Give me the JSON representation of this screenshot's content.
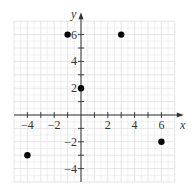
{
  "chart_data": {
    "type": "scatter",
    "title": "",
    "xlabel": "x",
    "ylabel": "y",
    "xlim": [
      -5,
      7
    ],
    "ylim": [
      -5,
      7
    ],
    "grid": true,
    "x_ticks": [
      -4,
      -2,
      2,
      4,
      6
    ],
    "y_ticks": [
      -4,
      -2,
      2,
      4,
      6
    ],
    "x_tick_labels": [
      "−4",
      "−2",
      "2",
      "4",
      "6"
    ],
    "y_tick_labels": [
      "−4",
      "−2",
      "2",
      "4",
      "6"
    ],
    "points": [
      {
        "x": -1,
        "y": 6
      },
      {
        "x": 3,
        "y": 6
      },
      {
        "x": 0,
        "y": 2
      },
      {
        "x": -4,
        "y": -3
      },
      {
        "x": 6,
        "y": -2
      }
    ],
    "colors": {
      "grid": "#e2e2e2",
      "axis": "#333333",
      "point": "#000000"
    }
  }
}
